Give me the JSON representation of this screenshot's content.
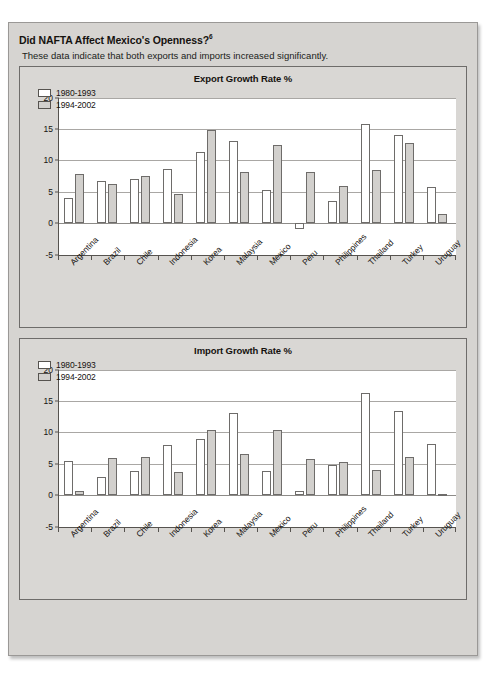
{
  "exhibit": {
    "title": "Did NAFTA Affect Mexico's Openness?",
    "title_superscript": "6",
    "subtitle": "These data indicate that both exports and imports increased significantly."
  },
  "colors": {
    "panel_background": "#d9d7d4",
    "exhibit_background": "#d6d4d1",
    "plot_background": "#ffffff",
    "series_a_fill": "#ffffff",
    "series_b_fill": "#d2d0cd",
    "axis": "#56534f",
    "gridline": "#a9a7a4"
  },
  "chart_data": [
    {
      "type": "bar",
      "title": "Export Growth Rate %",
      "xlabel": "",
      "ylabel": "",
      "ylim": [
        -5,
        20
      ],
      "yticks": [
        -5,
        0,
        5,
        10,
        15,
        20
      ],
      "grid": true,
      "legend_position": "top-left",
      "categories": [
        "Argentina",
        "Brazil",
        "Chile",
        "Indonesia",
        "Korea",
        "Malaysia",
        "Mexico",
        "Peru",
        "Philippines",
        "Thailand",
        "Turkey",
        "Uruguay"
      ],
      "series": [
        {
          "name": "1980-1993",
          "values": [
            4.0,
            6.7,
            7.0,
            8.6,
            11.3,
            13.0,
            5.3,
            -1.0,
            3.5,
            15.8,
            14.1,
            5.8
          ]
        },
        {
          "name": "1994-2002",
          "values": [
            7.8,
            6.3,
            7.5,
            4.7,
            14.9,
            8.2,
            12.5,
            8.2,
            5.9,
            8.4,
            12.7,
            1.5
          ]
        }
      ]
    },
    {
      "type": "bar",
      "title": "Import Growth Rate %",
      "xlabel": "",
      "ylabel": "",
      "ylim": [
        -5,
        20
      ],
      "yticks": [
        -5,
        0,
        5,
        10,
        15,
        20
      ],
      "grid": true,
      "legend_position": "top-left",
      "categories": [
        "Argentina",
        "Brazil",
        "Chile",
        "Indonesia",
        "Korea",
        "Malaysia",
        "Mexico",
        "Peru",
        "Philippines",
        "Thailand",
        "Turkey",
        "Uruguay"
      ],
      "series": [
        {
          "name": "1980-1993",
          "values": [
            5.5,
            2.9,
            3.8,
            7.9,
            8.9,
            13.1,
            3.8,
            0.7,
            4.8,
            16.2,
            13.4,
            8.2
          ]
        },
        {
          "name": "1994-2002",
          "values": [
            0.7,
            5.9,
            6.1,
            3.7,
            10.4,
            6.5,
            10.4,
            5.7,
            5.2,
            4.0,
            6.1,
            0.2
          ]
        }
      ]
    }
  ]
}
